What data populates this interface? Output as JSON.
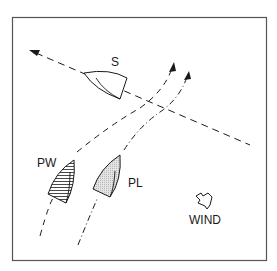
{
  "diagram": {
    "labels": {
      "starboard_boat": "S",
      "port_windward_boat": "PW",
      "port_leeward_boat": "PL",
      "wind": "WIND"
    },
    "colors": {
      "line": "#1a1a1a",
      "frame": "#555555",
      "pl_fill": "#e0e0e0",
      "background": "#ffffff"
    }
  }
}
